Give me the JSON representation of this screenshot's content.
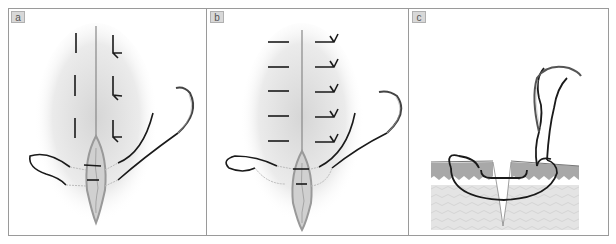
{
  "figure": {
    "panels": [
      {
        "id": "a",
        "label": "a",
        "content": "Wound with three interrupted sutures each side, needle and thread loop passing through wound edges"
      },
      {
        "id": "b",
        "label": "b",
        "content": "Wound with five horizontal sutures each side, needle and thread loop passing through wound edges"
      },
      {
        "id": "c",
        "label": "c",
        "content": "Cross-section of skin layers showing suture path with needle above"
      }
    ]
  },
  "colors": {
    "frame": "#9a9a9a",
    "label_bg": "#d8d8d8",
    "thread": "#1a1a1a",
    "skin_shadow": "#cfcfcf",
    "epidermis": "#a8a8a8",
    "dermis": "#e2e2e2"
  }
}
